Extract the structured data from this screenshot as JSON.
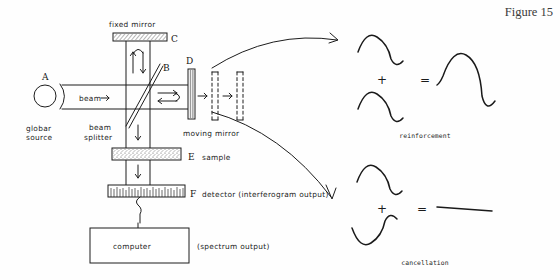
{
  "figure": {
    "title": "Figure 15"
  },
  "diagram": {
    "components": [
      {
        "key": "A",
        "letter": "A",
        "label": "globar\nsource",
        "label_line1": "globar",
        "label_line2": "source",
        "shape": "circle"
      },
      {
        "key": "B",
        "letter": "B",
        "label": "beam\nsplitter",
        "label_line1": "beam",
        "label_line2": "splitter",
        "shape": "diagonal-plate"
      },
      {
        "key": "C",
        "letter": "C",
        "label": "fixed mirror",
        "shape": "horizontal-hatched-bar"
      },
      {
        "key": "D",
        "letter": "D",
        "label": "moving mirror",
        "shape": "vertical-hatched-bar"
      },
      {
        "key": "E",
        "letter": "E",
        "label": "sample",
        "shape": "speckled-cell"
      },
      {
        "key": "F",
        "letter": "F",
        "label": "detector (interferogram output)",
        "shape": "comb-hatched-bar"
      }
    ],
    "beam_label": "beam",
    "computer_label": "computer",
    "computer_output_label": "(spectrum output)"
  },
  "waves": {
    "reinforcement": {
      "caption": "reinforcement",
      "plus": "+",
      "equals": "=",
      "input_a_phase": "crest-first",
      "input_b_phase": "crest-first",
      "result": "doubled-amplitude-wave"
    },
    "cancellation": {
      "caption": "cancellation",
      "plus": "+",
      "equals": "=",
      "input_a_phase": "crest-first",
      "input_b_phase": "trough-first",
      "result": "flat-line"
    }
  },
  "colors": {
    "ink": "#1d1d1d",
    "paper": "#fefefe",
    "title": "#3a3a3a"
  }
}
